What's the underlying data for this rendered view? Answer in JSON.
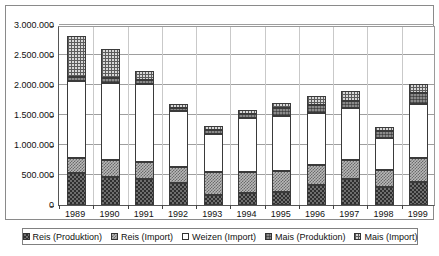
{
  "chart_data": {
    "type": "bar",
    "subtype": "stacked-column",
    "title": "",
    "subtitle": "",
    "xlabel": "",
    "ylabel": "",
    "categories": [
      "1989",
      "1990",
      "1991",
      "1992",
      "1993",
      "1994",
      "1995",
      "1996",
      "1997",
      "1998",
      "1999"
    ],
    "ylim": [
      0,
      3000000
    ],
    "ytick_values": [
      0,
      500000,
      1000000,
      1500000,
      2000000,
      2500000,
      3000000
    ],
    "ytick_labels": [
      "0",
      "500.000",
      "1.000.000",
      "1.500.000",
      "2.000.000",
      "2.500.000",
      "3.000.000"
    ],
    "grid": true,
    "grid_axis": "y",
    "legend_position": "bottom",
    "number_format": "de-DE thousands separator '.'",
    "series": [
      {
        "name": "Reis (Produktion)",
        "pattern": "dark-checkerboard",
        "color": "#4a4a4a",
        "values": [
          540000,
          470000,
          430000,
          360000,
          160000,
          200000,
          210000,
          340000,
          430000,
          300000,
          390000
        ]
      },
      {
        "name": "Reis (Import)",
        "pattern": "medium-checkerboard",
        "color": "#a8a8a8",
        "values": [
          240000,
          280000,
          280000,
          280000,
          390000,
          350000,
          350000,
          330000,
          320000,
          280000,
          400000
        ]
      },
      {
        "name": "Weizen (Import)",
        "pattern": "solid-white",
        "color": "#ffffff",
        "values": [
          1280000,
          1280000,
          1310000,
          920000,
          640000,
          900000,
          930000,
          870000,
          870000,
          540000,
          900000
        ]
      },
      {
        "name": "Mais (Produktion)",
        "pattern": "dark-grid",
        "color": "#707070",
        "values": [
          70000,
          80000,
          70000,
          60000,
          60000,
          70000,
          130000,
          120000,
          120000,
          110000,
          170000
        ]
      },
      {
        "name": "Mais (Import)",
        "pattern": "light-grid",
        "color": "#cfcfcf",
        "values": [
          690000,
          490000,
          140000,
          60000,
          70000,
          60000,
          80000,
          150000,
          160000,
          70000,
          160000
        ]
      }
    ],
    "totals": [
      2820000,
      2600000,
      2230000,
      1680000,
      1320000,
      1580000,
      1700000,
      1810000,
      1900000,
      1300000,
      2020000
    ]
  },
  "legend": {
    "entries": [
      {
        "label": "Reis (Produktion)"
      },
      {
        "label": "Reis (Import)"
      },
      {
        "label": "Weizen (Import)"
      },
      {
        "label": "Mais (Produktion)"
      },
      {
        "label": "Mais (Import)"
      }
    ]
  }
}
